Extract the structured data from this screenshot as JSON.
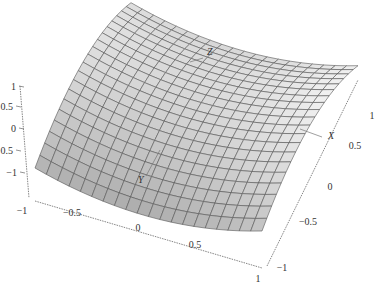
{
  "chart_data": {
    "type": "surface3d",
    "title": "",
    "function": "z = y^2 - x^2 (saddle / hyperbolic paraboloid)",
    "x_range": [
      -1,
      1
    ],
    "y_range": [
      -1,
      1
    ],
    "z_range": [
      -1,
      1
    ],
    "grid_divisions": 20,
    "axis_labels": {
      "x": "X",
      "y": "Y",
      "z": "Z"
    },
    "ticks": {
      "left_vertical": [
        "1",
        "0.5",
        "0",
        "-0.5",
        "-1"
      ],
      "bottom_front": [
        "-1",
        "-0.5",
        "0",
        "0.5",
        "1"
      ],
      "right_depth": [
        "-1",
        "-0.5",
        "0",
        "0.5",
        "1"
      ]
    },
    "shading": "gray, lighter toward top, darker on near-left face",
    "mesh_color": "#555555",
    "surface_light": "#f4f4f4",
    "surface_dark": "#9a9a9a",
    "grid": false,
    "legend": null
  }
}
